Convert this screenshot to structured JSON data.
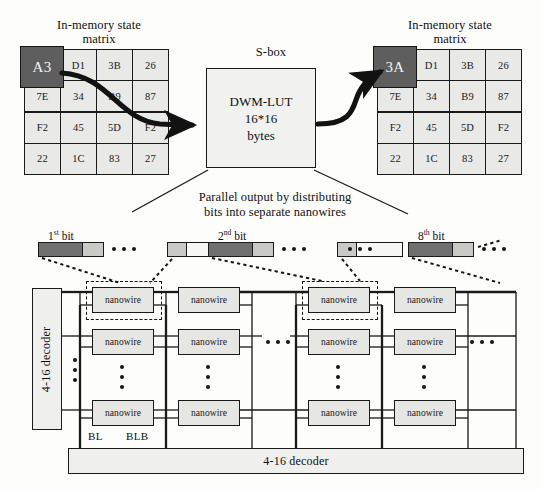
{
  "diagram": {
    "title_left": "In-memory state\nmatrix",
    "title_right": "In-memory state\nmatrix",
    "sbox_label": "S-box",
    "sbox_line1": "DWM-LUT",
    "sbox_line2": "16*16",
    "sbox_line3": "bytes",
    "parallel_caption": "Parallel output by distributing\nbits into separate nanowires",
    "nanowire_label": "nanowire",
    "decoder_left_label": "4-16 decoder",
    "decoder_bottom_label": "4-16 decoder",
    "bl_label": "BL",
    "blb_label": "BLB",
    "ellipsis": "• • •"
  },
  "matrix_left": {
    "rows": [
      [
        "A3",
        "D1",
        "3B",
        "26"
      ],
      [
        "7E",
        "34",
        "B9",
        "87"
      ],
      [
        "F2",
        "45",
        "5D",
        "F2"
      ],
      [
        "22",
        "1C",
        "83",
        "27"
      ]
    ],
    "highlight": "A3",
    "highlight_row": 0,
    "highlight_col": 0
  },
  "matrix_right": {
    "rows": [
      [
        "3A",
        "D1",
        "3B",
        "26"
      ],
      [
        "7E",
        "34",
        "B9",
        "87"
      ],
      [
        "F2",
        "45",
        "5D",
        "F2"
      ],
      [
        "22",
        "1C",
        "83",
        "27"
      ]
    ],
    "highlight": "3A",
    "highlight_row": 0,
    "highlight_col": 0
  },
  "bits": [
    {
      "ordinal": "1",
      "suffix": "st",
      "label": "bit"
    },
    {
      "ordinal": "2",
      "suffix": "nd",
      "label": "bit"
    },
    {
      "ordinal": "8",
      "suffix": "th",
      "label": "bit"
    }
  ],
  "colors": {
    "ink": "#1a1a1a",
    "cell_fill": "#e9e9e7",
    "highlight_fill": "#5e5e5e",
    "nanowire_fill": "#e6e6e3",
    "decoder_fill": "#efefed",
    "bit_dark": "#6f6f6f",
    "bit_mid": "#c9c9c6",
    "bit_light": "#f7f7f5",
    "page_bg": "#fdfdfc"
  }
}
